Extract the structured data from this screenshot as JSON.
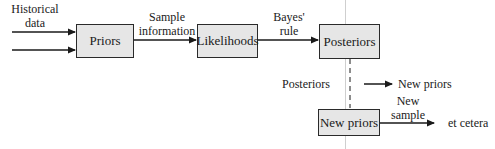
{
  "diagram": {
    "boxes": {
      "priors": "Priors",
      "likelihoods": "Likelihoods",
      "posteriors": "Posteriors",
      "new_priors": "New priors"
    },
    "labels": {
      "historical_line1": "Historical",
      "historical_line2": "data",
      "sample_line1": "Sample",
      "sample_line2": "information",
      "bayes_line1": "Bayes'",
      "bayes_line2": "rule",
      "posteriors_text": "Posteriors",
      "new_priors_text": "New priors",
      "new_sample_line1": "New",
      "new_sample_line2": "sample",
      "et_cetera": "et cetera"
    },
    "colors": {
      "box_fill": "#e6e6e6",
      "stroke": "#2a2a2a"
    }
  }
}
